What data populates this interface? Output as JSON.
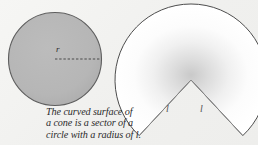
{
  "figure": {
    "name": "cone-curved-surface-diagram",
    "background_color": "#f1f1ef",
    "caption": {
      "line1": "The curved surface of",
      "line2": "a cone is a sector of a",
      "line3": "circle with a radius of l."
    },
    "circle": {
      "name": "shaded-circle",
      "fill_color": "#b5b5b5",
      "stroke_color": "#5a5a5a",
      "center_x": 55,
      "center_y": 59,
      "radius": 47,
      "radius_label": "r",
      "radius_line_style": "dashed"
    },
    "sector": {
      "name": "circle-sector",
      "fill_color": "#ffffff",
      "stroke_color": "#4a4a4a",
      "center_x": 191,
      "center_y": 80,
      "radius": 76,
      "gap_angle_degrees": 86,
      "radius_label_left": "l",
      "radius_label_right": "l",
      "shading": "radial-gradient-from-vertex"
    }
  }
}
